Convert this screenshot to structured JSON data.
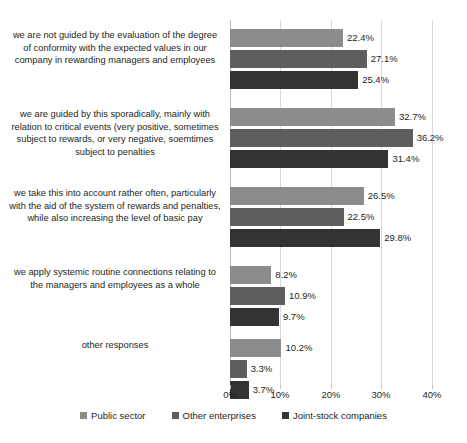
{
  "chart_data": {
    "type": "bar",
    "orientation": "horizontal",
    "title": "",
    "xlabel": "",
    "ylabel": "",
    "xlim": [
      0,
      40
    ],
    "grid": true,
    "legend_position": "bottom",
    "xticks": [
      "0%",
      "10%",
      "20%",
      "30%",
      "40%"
    ],
    "xtick_values": [
      0,
      10,
      20,
      30,
      40
    ],
    "categories": [
      "we are not guided by the evaluation of the degree of conformity with the expected values in our company in rewarding managers and employees",
      "we are guided by this sporadically, mainly with relation to critical events (very positive, sometimes subject to rewards, or very negative, soemtimes subject to penalties",
      "we take this into account rather often, particularly with the aid of the system of rewards and penalties, while also increasing the level of basic pay",
      "we apply systemic routine connections relating to the managers and employees as a whole",
      "other responses"
    ],
    "series": [
      {
        "name": "Public sector",
        "color": "#8c8c8c",
        "values": [
          22.4,
          32.7,
          26.5,
          8.2,
          10.2
        ],
        "labels": [
          "22.4%",
          "32.7%",
          "26.5%",
          "8.2%",
          "10.2%"
        ]
      },
      {
        "name": "Other enterprises",
        "color": "#5e5e5e",
        "values": [
          27.1,
          36.2,
          22.5,
          10.9,
          3.3
        ],
        "labels": [
          "27.1%",
          "36.2%",
          "22.5%",
          "10.9%",
          "3.3%"
        ]
      },
      {
        "name": "Joint-stock companies",
        "color": "#333333",
        "values": [
          25.4,
          31.4,
          29.8,
          9.7,
          3.7
        ],
        "labels": [
          "25.4%",
          "31.4%",
          "29.8%",
          "9.7%",
          "3.7%"
        ]
      }
    ]
  }
}
